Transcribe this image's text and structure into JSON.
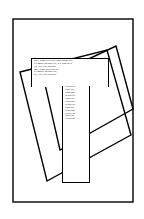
{
  "document": {
    "title": "Lorem Ipsum Layout Slide",
    "page_width": 144,
    "page_height": 219,
    "background_color": "#ffffff",
    "stroke_color": "#000000",
    "text_color": "#0a0a0a"
  },
  "frame": {
    "name": "page-border",
    "x": 13,
    "y": 19,
    "width": 120,
    "height": 183,
    "stroke_width": 1.4
  },
  "shapes": [
    {
      "name": "rotated-quad-left",
      "type": "polygon",
      "points": "20,72 107,50 131,135 47,181",
      "stroke_width": 1.4,
      "fill": "none"
    },
    {
      "name": "rotated-quad-right",
      "type": "polygon",
      "points": "44,80 116,46 133,109 60,150",
      "stroke_width": 1.4,
      "fill": "none"
    }
  ],
  "text_blocks": {
    "wide": {
      "name": "wide-text-panel",
      "x": 31,
      "y": 58,
      "width": 78,
      "height": 29,
      "lines": [
        "amet, consectetur sadLorem ipsum doli",
        "ut tempori incidunt dltr, sed diam no n",
        "ciat. Sict clita kasdlubi",
        "amet, consectetur sadLort",
        "ut tempori incidunt dltr,",
        "ctat. Sict clita kasdlubi"
      ]
    },
    "narrow": {
      "name": "narrow-text-column",
      "x": 62,
      "y": 86,
      "width": 28,
      "height": 97,
      "lines": [
        "ur sadLort",
        "idunt dltr,",
        "a kasdlubi",
        "ut sadLort",
        "idunt dltr,",
        "a kasdlubi",
        "ut sadLort",
        "idunt dltr,",
        "a kasdlubi",
        "ur sadLort",
        "idunt dltr,",
        "a kasdlubi"
      ]
    }
  }
}
